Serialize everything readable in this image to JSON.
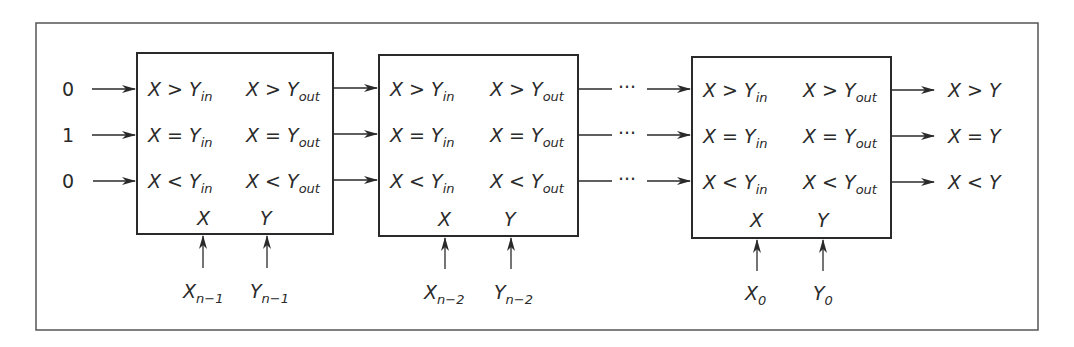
{
  "diagram": {
    "type": "cascaded magnitude comparator",
    "initial_inputs": [
      "0",
      "1",
      "0"
    ],
    "stages": [
      {
        "inputs": [
          {
            "base": "X > Y",
            "sub": "in"
          },
          {
            "base": "X = Y",
            "sub": "in"
          },
          {
            "base": "X < Y",
            "sub": "in"
          }
        ],
        "outputs": [
          {
            "base": "X > Y",
            "sub": "out"
          },
          {
            "base": "X = Y",
            "sub": "out"
          },
          {
            "base": "X < Y",
            "sub": "out"
          }
        ],
        "port_x": "X",
        "port_y": "Y",
        "bit_x": {
          "base": "X",
          "sub": "n−1"
        },
        "bit_y": {
          "base": "Y",
          "sub": "n−1"
        }
      },
      {
        "inputs": [
          {
            "base": "X > Y",
            "sub": "in"
          },
          {
            "base": "X = Y",
            "sub": "in"
          },
          {
            "base": "X < Y",
            "sub": "in"
          }
        ],
        "outputs": [
          {
            "base": "X > Y",
            "sub": "out"
          },
          {
            "base": "X = Y",
            "sub": "out"
          },
          {
            "base": "X < Y",
            "sub": "out"
          }
        ],
        "port_x": "X",
        "port_y": "Y",
        "bit_x": {
          "base": "X",
          "sub": "n−2"
        },
        "bit_y": {
          "base": "Y",
          "sub": "n−2"
        }
      },
      {
        "inputs": [
          {
            "base": "X > Y",
            "sub": "in"
          },
          {
            "base": "X = Y",
            "sub": "in"
          },
          {
            "base": "X < Y",
            "sub": "in"
          }
        ],
        "outputs": [
          {
            "base": "X > Y",
            "sub": "out"
          },
          {
            "base": "X = Y",
            "sub": "out"
          },
          {
            "base": "X < Y",
            "sub": "out"
          }
        ],
        "port_x": "X",
        "port_y": "Y",
        "bit_x": {
          "base": "X",
          "sub": "0"
        },
        "bit_y": {
          "base": "Y",
          "sub": "0"
        }
      }
    ],
    "ellipsis": "···",
    "final_outputs": [
      "X > Y",
      "X = Y",
      "X < Y"
    ],
    "colors": {
      "stroke": "#2a2a2a",
      "background": "#ffffff"
    }
  }
}
